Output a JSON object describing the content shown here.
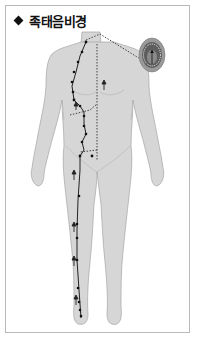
{
  "title": {
    "marker": "diamond",
    "text": "족태음비경"
  },
  "figure": {
    "meridian": "족태음비경",
    "body_color": "#d4d4d4",
    "body_outline": "#a8a8a8",
    "meridian_line_color": "#222222",
    "inset": {
      "subject": "mouth-tongue-detail",
      "fill": "#9a9a9a"
    }
  },
  "colors": {
    "frame_border": "#b9b9b9",
    "background": "#ffffff",
    "text": "#111111"
  }
}
